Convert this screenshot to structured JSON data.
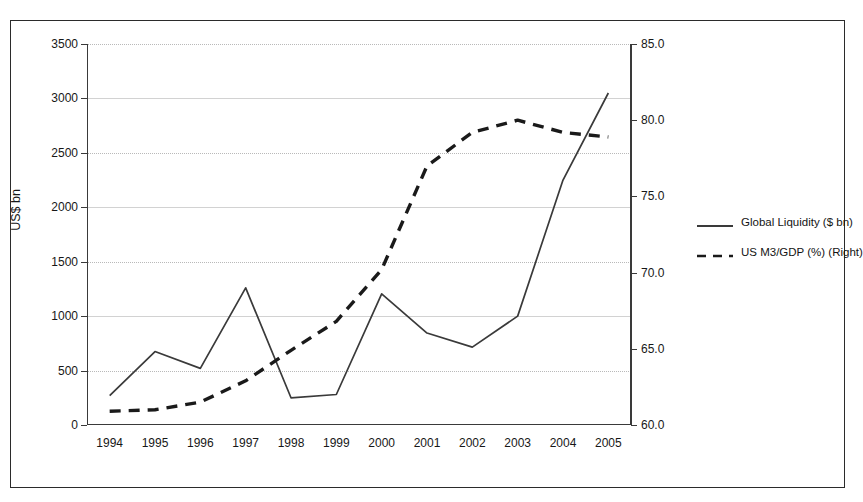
{
  "chart_data": {
    "type": "line",
    "title": "",
    "xlabel": "",
    "ylabel": "US$ bn",
    "y2label": "",
    "grid": true,
    "legend_position": "right",
    "categories": [
      "1994",
      "1995",
      "1996",
      "1997",
      "1998",
      "1999",
      "2000",
      "2001",
      "2002",
      "2003",
      "2004",
      "2005"
    ],
    "ylim": [
      0,
      3500
    ],
    "yticks": [
      "0",
      "500",
      "1000",
      "1500",
      "2000",
      "2500",
      "3000",
      "3500"
    ],
    "ytick_values": [
      0,
      500,
      1000,
      1500,
      2000,
      2500,
      3000,
      3500
    ],
    "y2lim": [
      60.0,
      85.0
    ],
    "y2ticks": [
      "60.0",
      "65.0",
      "70.0",
      "75.0",
      "80.0",
      "85.0"
    ],
    "y2tick_values": [
      60.0,
      65.0,
      70.0,
      75.0,
      80.0,
      85.0
    ],
    "series": [
      {
        "name": "Global Liquidity ($ bn)",
        "axis": "left",
        "style": "solid",
        "color": "#3a3a3a",
        "values": [
          270,
          675,
          520,
          1260,
          250,
          280,
          1205,
          845,
          715,
          1000,
          2250,
          3050
        ]
      },
      {
        "name": "US M3/GDP (%) (Right)",
        "axis": "right",
        "style": "dashed",
        "color": "#1a1a1a",
        "values": [
          60.9,
          61.0,
          61.5,
          62.9,
          64.9,
          66.8,
          70.2,
          77.0,
          79.2,
          80.0,
          79.2,
          78.9
        ]
      }
    ]
  },
  "legend": {
    "items": [
      {
        "label": "Global Liquidity ($ bn)",
        "style": "solid"
      },
      {
        "label": "US M3/GDP (%) (Right)",
        "style": "dashed"
      }
    ]
  }
}
